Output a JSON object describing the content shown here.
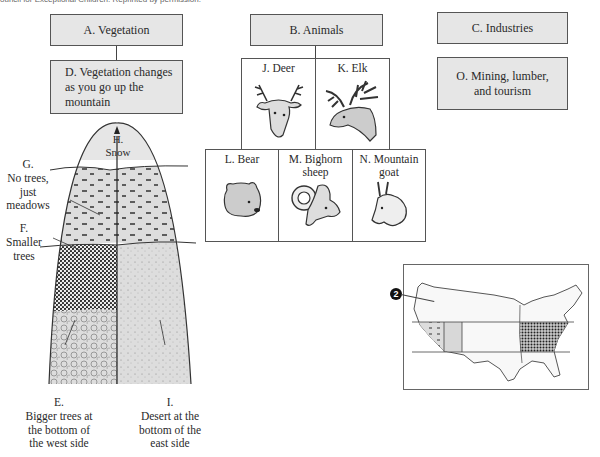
{
  "header": {
    "credit_text": "ouncil for Exceptional Children. Reprinted by permission."
  },
  "categories": {
    "vegetation": {
      "label": "A. Vegetation",
      "detail": "D. Vegetation changes as you go up the mountain"
    },
    "animals": {
      "label": "B. Animals"
    },
    "industries": {
      "label": "C. Industries",
      "detail": "O. Mining, lumber, and tourism"
    }
  },
  "animals": [
    {
      "label": "J. Deer",
      "icon": "deer-icon"
    },
    {
      "label": "K. Elk",
      "icon": "elk-icon"
    },
    {
      "label": "L. Bear",
      "icon": "bear-icon"
    },
    {
      "label": "M. Bighorn sheep",
      "icon": "bighorn-sheep-icon"
    },
    {
      "label": "N. Mountain goat",
      "icon": "mountain-goat-icon"
    }
  ],
  "mountain": {
    "zones": [
      {
        "label": "H. Snow",
        "line1": "H.",
        "line2": "Snow"
      },
      {
        "label": "G. No trees, just meadows",
        "line1": "G.",
        "line2": "No trees,",
        "line3": "just",
        "line4": "meadows"
      },
      {
        "label": "F. Smaller trees",
        "line1": "F.",
        "line2": "Smaller",
        "line3": "trees"
      },
      {
        "label": "E. Bigger trees at the bottom of the west side",
        "line1": "E.",
        "line2": "Bigger trees at",
        "line3": "the bottom of",
        "line4": "the west side"
      },
      {
        "label": "I. Desert at the bottom of the east side",
        "line1": "I.",
        "line2": "Desert at the",
        "line3": "bottom of the",
        "line4": "east side"
      }
    ]
  },
  "map": {
    "marker": "2",
    "title": "United States map"
  },
  "colors": {
    "box_fill": "#e6e6e6",
    "border": "#555555",
    "zone_fill": "#dcdcdc",
    "dark_pattern": "#333333"
  }
}
